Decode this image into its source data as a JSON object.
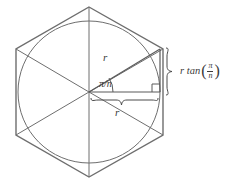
{
  "figure": {
    "type": "geometry-diagram",
    "canvas": {
      "width": 228,
      "height": 184,
      "background": "#ffffff"
    },
    "colors": {
      "hexagon_stroke": "#6e6e6e",
      "circle_stroke": "#6e6e6e",
      "radius_stroke": "#6e6e6e",
      "triangle_stroke": "#5a5a5a",
      "brace_stroke": "#4a4a4a",
      "text": "#3a3a3a"
    },
    "shapes": {
      "hexagon": {
        "name": "regular-hexagon",
        "sides": 6,
        "orientation": "vertex-top",
        "center": [
          89,
          92
        ],
        "circumradius": 85,
        "vertices": [
          [
            89,
            7
          ],
          [
            163,
            49
          ],
          [
            163,
            135
          ],
          [
            89,
            177
          ],
          [
            16,
            135
          ],
          [
            16,
            49
          ]
        ]
      },
      "circle": {
        "name": "inscribed-circle",
        "center": [
          89,
          92
        ],
        "radius": 71
      },
      "radii": {
        "name": "center-to-vertex-radii",
        "count": 6,
        "from": [
          89,
          92
        ],
        "to": [
          [
            89,
            7
          ],
          [
            163,
            49
          ],
          [
            163,
            135
          ],
          [
            89,
            177
          ],
          [
            16,
            135
          ],
          [
            16,
            49
          ]
        ]
      },
      "triangle": {
        "name": "apothem-right-triangle",
        "vertices": {
          "center": [
            89,
            92
          ],
          "foot": [
            160,
            92
          ],
          "vertex": [
            160,
            49
          ]
        },
        "right_angle_at": "foot",
        "right_angle_marker_size": 7
      }
    },
    "labels": {
      "hypotenuse": "r",
      "base": "r",
      "angle": "π/n",
      "angle_numerator": "π",
      "angle_denominator": "n",
      "height_prefix": "r tan",
      "height_open_paren": "(",
      "height_numerator": "π",
      "height_denominator": "n",
      "height_close_paren": ")",
      "height_full": "r tan (π/n)"
    },
    "braces": {
      "vertical": {
        "name": "height-brace",
        "orientation": "vertical",
        "from": [
          168,
          48
        ],
        "to": [
          168,
          95
        ],
        "labels_element": "r tan (π/n)"
      },
      "horizontal": {
        "name": "base-brace",
        "orientation": "horizontal",
        "from": [
          91,
          101
        ],
        "to": [
          158,
          101
        ],
        "labels_element": "r"
      }
    }
  }
}
